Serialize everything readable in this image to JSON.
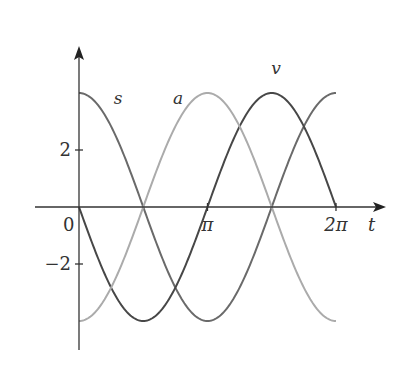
{
  "chart_data": {
    "type": "line",
    "title": "",
    "xlabel": "t",
    "ylabel": "",
    "x_ticks": [
      {
        "value": 0,
        "label": "0"
      },
      {
        "value": 3.14159,
        "label": "π"
      },
      {
        "value": 6.28319,
        "label": "2π"
      }
    ],
    "y_ticks": [
      {
        "value": 2,
        "label": "2"
      },
      {
        "value": -2,
        "label": "−2"
      }
    ],
    "xlim": [
      -1.1,
      7.4
    ],
    "ylim": [
      -5.0,
      5.6
    ],
    "grid": false,
    "legend": "inline curve labels",
    "series": [
      {
        "name": "s",
        "formula": "4cos(t)",
        "color": "#6a6a6a",
        "label_pos": [
          0.85,
          3.6
        ],
        "x": [
          0,
          0.785,
          1.571,
          2.356,
          3.142,
          3.927,
          4.712,
          5.498,
          6.283
        ],
        "values": [
          4,
          2.83,
          0,
          -2.83,
          -4,
          -2.83,
          0,
          2.83,
          4
        ]
      },
      {
        "name": "v",
        "formula": "-4sin(t)",
        "color": "#474747",
        "label_pos": [
          4.7,
          4.65
        ],
        "x": [
          0,
          0.785,
          1.571,
          2.356,
          3.142,
          3.927,
          4.712,
          5.498,
          6.283
        ],
        "values": [
          0,
          -2.83,
          -4,
          -2.83,
          0,
          2.83,
          4,
          2.83,
          0
        ]
      },
      {
        "name": "a",
        "formula": "-4cos(t)",
        "color": "#ababab",
        "label_pos": [
          2.3,
          3.6
        ],
        "x": [
          0,
          0.785,
          1.571,
          2.356,
          3.142,
          3.927,
          4.712,
          5.498,
          6.283
        ],
        "values": [
          -4,
          -2.83,
          0,
          2.83,
          4,
          2.83,
          0,
          -2.83,
          -4
        ]
      }
    ]
  }
}
